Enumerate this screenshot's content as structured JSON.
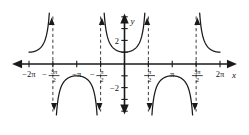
{
  "figure": {
    "title": "",
    "x_axis_label": "x",
    "y_axis_label": "y"
  },
  "ticks": {
    "x_labels": [
      {
        "value": -6.2832,
        "text": "−2π",
        "kind": "plain"
      },
      {
        "value": -4.7124,
        "text": "−3π/2",
        "kind": "fraction",
        "sign": "−",
        "num": "3π",
        "den": "2"
      },
      {
        "value": -3.1416,
        "text": "−π",
        "kind": "plain"
      },
      {
        "value": -1.5708,
        "text": "−π/2",
        "kind": "fraction",
        "sign": "−",
        "num": "π",
        "den": "2"
      },
      {
        "value": 1.5708,
        "text": "π/2",
        "kind": "fraction",
        "sign": "",
        "num": "π",
        "den": "2"
      },
      {
        "value": 3.1416,
        "text": "π",
        "kind": "plain"
      },
      {
        "value": 4.7124,
        "text": "3π/2",
        "kind": "fraction",
        "sign": "",
        "num": "3π",
        "den": "2"
      },
      {
        "value": 6.2832,
        "text": "2π",
        "kind": "plain"
      }
    ],
    "y_labels": [
      {
        "value": 2,
        "text": "2"
      },
      {
        "value": -2,
        "text": "−2"
      }
    ]
  },
  "chart_data": {
    "type": "line",
    "title": "",
    "xlabel": "x",
    "ylabel": "y",
    "xlim": [
      -7.33,
      7.33
    ],
    "ylim": [
      -4.2,
      4.2
    ],
    "grid": false,
    "legend": null,
    "function": "y = sec(x)",
    "x_tick_values": [
      -6.2832,
      -4.7124,
      -3.1416,
      -1.5708,
      1.5708,
      3.1416,
      4.7124,
      6.2832
    ],
    "x_tick_labels": [
      "−2π",
      "−3π/2",
      "−π",
      "−π/2",
      "π/2",
      "π",
      "3π/2",
      "2π"
    ],
    "y_tick_values": [
      2,
      -2
    ],
    "y_tick_labels": [
      "2",
      "−2"
    ],
    "asymptotes_x": [
      -4.7124,
      -1.5708,
      1.5708,
      4.7124
    ],
    "series": [
      {
        "name": "sec(x) branch -2π..-3π/2",
        "x_range": [
          -6.2832,
          -4.7124
        ],
        "y_at_vertex": 1,
        "vertex_x": -6.2832,
        "direction": "up"
      },
      {
        "name": "sec(x) branch -3π/2..-π/2",
        "x_range": [
          -4.7124,
          -1.5708
        ],
        "y_at_vertex": -1,
        "vertex_x": -3.1416,
        "direction": "down"
      },
      {
        "name": "sec(x) branch -π/2..π/2",
        "x_range": [
          -1.5708,
          1.5708
        ],
        "y_at_vertex": 1,
        "vertex_x": 0,
        "direction": "up"
      },
      {
        "name": "sec(x) branch π/2..3π/2",
        "x_range": [
          1.5708,
          4.7124
        ],
        "y_at_vertex": -1,
        "vertex_x": 3.1416,
        "direction": "down"
      },
      {
        "name": "sec(x) branch 3π/2..2π",
        "x_range": [
          4.7124,
          6.2832
        ],
        "y_at_vertex": 1,
        "vertex_x": 6.2832,
        "direction": "up"
      }
    ]
  },
  "colors": {
    "curve": "#1a1a1a",
    "axis": "#1a1a1a",
    "asymptote": "#3c3c3c",
    "background": "#ffffff"
  }
}
